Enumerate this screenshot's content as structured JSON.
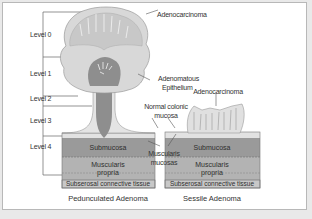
{
  "figure": {
    "levels": [
      "Level 0",
      "Level 1",
      "Level 2",
      "Level 3",
      "Level 4"
    ],
    "labels": {
      "adenocarcinoma_pedunculated": "Adenocarcinoma",
      "adenomatous_epithelium_line1": "Adenomatous",
      "adenomatous_epithelium_line2": "Epithelium",
      "adenocarcinoma_sessile": "Adenocarcinoma",
      "normal_mucosa_line1": "Normal colonic",
      "normal_mucosa_line2": "mucosa",
      "muscularis_mucosae_line1": "Muscularis",
      "muscularis_mucosae_line2": "mucosas"
    },
    "pedunculated": {
      "layers": {
        "submucosa": "Submucosa",
        "muscularis_propria_line1": "Muscularis",
        "muscularis_propria_line2": "propria",
        "subserosal": "Subserosal connective tissue"
      },
      "caption": "Pedunculated Adenoma"
    },
    "sessile": {
      "layers": {
        "submucosa": "Submucosa",
        "muscularis_propria_line1": "Muscularis",
        "muscularis_propria_line2": "propria",
        "subserosal": "Subserosal connective tissue"
      },
      "caption": "Sessile Adenoma"
    },
    "colors": {
      "background": "#ffffff",
      "outer": "#e9e9e9",
      "adenoma_head": "#dcdcdc",
      "stalk_core": "#8e8e8e",
      "submucosa": "#9a9a9a",
      "muscularis_propria": "#b3b3b3",
      "subserosal": "#c8c8c8",
      "lines": "#555555"
    }
  }
}
